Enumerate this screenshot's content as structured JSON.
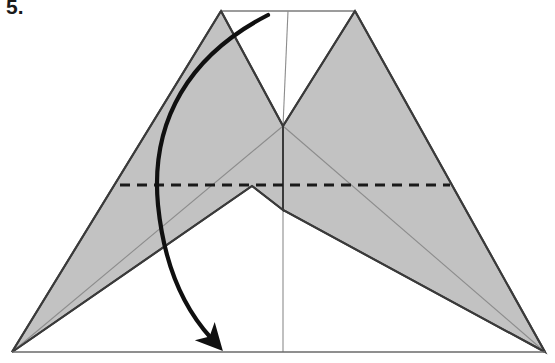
{
  "figure": {
    "kind": "origami-fold-diagram",
    "step_number": "5.",
    "caption": "",
    "width": 555,
    "height": 363
  },
  "colors": {
    "paper_front": "#ffffff",
    "paper_back_shaded": "#c2c2c2",
    "outline": "#3a3a3a",
    "crease_thin": "#8c8c8c",
    "fold_line": "#1a1a1a",
    "arrow": "#101010",
    "background": "#ffffff"
  },
  "geometry": {
    "base_left": [
      12,
      352
    ],
    "base_right": [
      545,
      352
    ],
    "top_left_peak": [
      221,
      11
    ],
    "top_right_peak": [
      355,
      11
    ],
    "top_edge_left": [
      221,
      11
    ],
    "top_edge_right": [
      355,
      11
    ],
    "center_top": [
      288,
      11
    ],
    "inner_v_bottom": [
      283,
      126
    ],
    "center_vertex": [
      283,
      210
    ],
    "left_notch": [
      252,
      186
    ],
    "left_wing_tip": [
      12,
      352
    ],
    "right_wing_tip": [
      545,
      352
    ],
    "center_stem_bottom": [
      283,
      352
    ]
  },
  "fold_line": {
    "name": "valley-fold",
    "style": "dashed",
    "x1": 120,
    "y1": 185,
    "x2": 450,
    "y2": 185,
    "dash_pattern": "10 7",
    "stroke_width": 3
  },
  "arrow": {
    "name": "fold-direction-arrow",
    "label": "",
    "start": [
      268,
      15
    ],
    "end": [
      215,
      341
    ],
    "control_1": [
      160,
      70
    ],
    "control_2": [
      155,
      250
    ],
    "head_angle_deg": 62,
    "stroke_width": 4.2
  },
  "shapes": [
    {
      "name": "left-shaded-wing",
      "fill": "shaded",
      "points": "221,11 283,126 283,210 252,186 12,352"
    },
    {
      "name": "right-shaded-wing",
      "fill": "shaded",
      "points": "355,11 545,352 283,210 283,126"
    }
  ],
  "creases": [
    {
      "name": "crease-top-edge",
      "weight": "thin",
      "x1": 221,
      "y1": 11,
      "x2": 355,
      "y2": 11
    },
    {
      "name": "crease-center-vertical-top",
      "weight": "thin",
      "x1": 288,
      "y1": 11,
      "x2": 283,
      "y2": 126
    },
    {
      "name": "crease-center-vertical-bottom",
      "weight": "thin",
      "x1": 283,
      "y1": 210,
      "x2": 283,
      "y2": 352
    },
    {
      "name": "crease-left-diagonal",
      "weight": "thin",
      "x1": 221,
      "y1": 11,
      "x2": 12,
      "y2": 352
    },
    {
      "name": "crease-right-diagonal",
      "weight": "thin",
      "x1": 355,
      "y1": 11,
      "x2": 545,
      "y2": 352
    },
    {
      "name": "crease-left-inner-diagonal",
      "weight": "thin",
      "x1": 283,
      "y1": 126,
      "x2": 12,
      "y2": 352
    },
    {
      "name": "crease-right-inner-diagonal",
      "weight": "thin",
      "x1": 283,
      "y1": 126,
      "x2": 545,
      "y2": 352
    },
    {
      "name": "baseline",
      "weight": "thin",
      "x1": 12,
      "y1": 352,
      "x2": 545,
      "y2": 352
    }
  ]
}
